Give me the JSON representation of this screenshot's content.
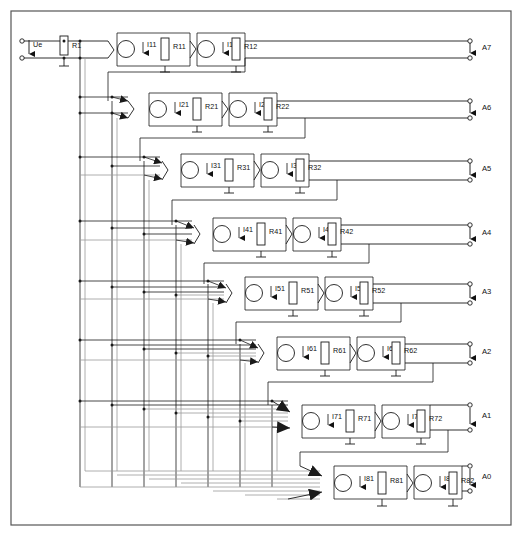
{
  "diagram": {
    "frame_color": "#555555",
    "wire_color": "#1a1a1a",
    "bus_color": "#9a9a9a",
    "input": {
      "source_label": "Ue",
      "resistor_label": "R1"
    },
    "rows": [
      {
        "id": "row1",
        "y": 44,
        "x_start": 96,
        "fan_in": 1,
        "source1": "I11",
        "res1": "R11",
        "source2": "I12",
        "res2": "R12",
        "output": "A7",
        "out_y_top": 41,
        "out_y_bot": 58
      },
      {
        "id": "row2",
        "y": 104,
        "x_start": 128,
        "fan_in": 2,
        "source1": "I21",
        "res1": "R21",
        "source2": "I22",
        "res2": "R22",
        "output": "A6",
        "out_y_top": 101,
        "out_y_bot": 118
      },
      {
        "id": "row3",
        "y": 170,
        "x_start": 160,
        "fan_in": 3,
        "source1": "I31",
        "res1": "R31",
        "source2": "I32",
        "res2": "R32",
        "output": "A5",
        "out_y_top": 161,
        "out_y_bot": 180
      },
      {
        "id": "row4",
        "y": 234,
        "x_start": 192,
        "fan_in": 4,
        "source1": "I41",
        "res1": "R41",
        "source2": "I42",
        "res2": "R42",
        "output": "A4",
        "out_y_top": 225,
        "out_y_bot": 244
      },
      {
        "id": "row5",
        "y": 293,
        "x_start": 224,
        "fan_in": 5,
        "source1": "I51",
        "res1": "R51",
        "source2": "I52",
        "res2": "R52",
        "output": "A3",
        "out_y_top": 284,
        "out_y_bot": 303
      },
      {
        "id": "row6",
        "y": 353,
        "x_start": 256,
        "fan_in": 6,
        "source1": "I61",
        "res1": "R61",
        "source2": "I62",
        "res2": "R62",
        "output": "A2",
        "out_y_top": 344,
        "out_y_bot": 363
      },
      {
        "id": "row7",
        "y": 422,
        "x_start": 288,
        "fan_in": 7,
        "source1": "I71",
        "res1": "R71",
        "source2": "I72",
        "res2": "R72",
        "output": "A1",
        "out_y_top": 405,
        "out_y_bot": 430
      },
      {
        "id": "row8",
        "y": 483,
        "x_start": 320,
        "fan_in": 7,
        "source1": "I81",
        "res1": "R81",
        "source2": "I82",
        "res2": "R82",
        "output": "A0",
        "out_y_top": 466,
        "out_y_bot": 491
      }
    ],
    "outputs": [
      "A7",
      "A6",
      "A5",
      "A4",
      "A3",
      "A2",
      "A1",
      "A0"
    ],
    "current_sources": [
      "I11",
      "I12",
      "I21",
      "I22",
      "I31",
      "I32",
      "I41",
      "I42",
      "I51",
      "I52",
      "I61",
      "I62",
      "I71",
      "I72",
      "I81",
      "I82"
    ],
    "resistors": [
      "R1",
      "R11",
      "R12",
      "R21",
      "R22",
      "R31",
      "R32",
      "R41",
      "R42",
      "R51",
      "R52",
      "R61",
      "R62",
      "R71",
      "R72",
      "R81",
      "R82"
    ]
  }
}
